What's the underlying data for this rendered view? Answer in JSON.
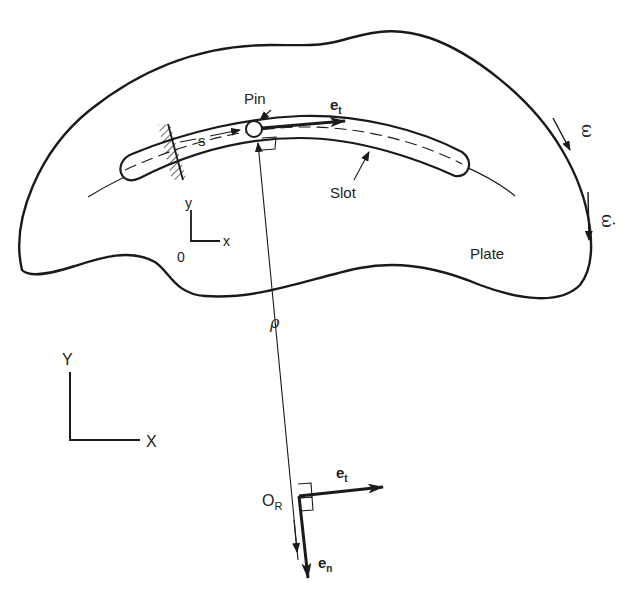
{
  "diagram": {
    "type": "kinematics-figure",
    "labels": {
      "pin": "Pin",
      "slot": "Slot",
      "plate": "Plate",
      "arc_length": "s",
      "tangent_unit_top": "e",
      "tangent_unit_top_sub": "t",
      "tangent_unit_origin": "e",
      "tangent_unit_origin_sub": "t",
      "normal_unit": "e",
      "normal_unit_sub": "n",
      "radius_of_curvature": "ρ",
      "angular_velocity": "ω",
      "angular_acceleration": "ω̇",
      "center_of_curvature": "O",
      "center_of_curvature_sub": "R",
      "local_origin": "0",
      "local_x": "x",
      "local_y": "y",
      "global_x": "X",
      "global_y": "Y"
    },
    "colors": {
      "stroke": "#1a1a1a",
      "background": "#ffffff"
    }
  }
}
